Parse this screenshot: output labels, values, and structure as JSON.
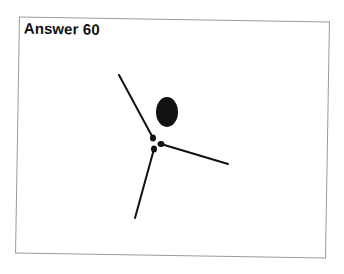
{
  "card": {
    "title": "Answer 60"
  },
  "figure": {
    "stroke_color": "#111111",
    "lines": [
      {
        "name": "upper-left-line",
        "x1": 119,
        "y1": 75,
        "x2": 153,
        "y2": 138
      },
      {
        "name": "right-line",
        "x1": 161,
        "y1": 144,
        "x2": 228,
        "y2": 164
      },
      {
        "name": "lower-line",
        "x1": 154,
        "y1": 149,
        "x2": 135,
        "y2": 218
      }
    ],
    "dots": [
      {
        "cx": 153,
        "cy": 138,
        "rx": 3,
        "ry": 3.5
      },
      {
        "cx": 161,
        "cy": 144,
        "rx": 3.5,
        "ry": 3
      },
      {
        "cx": 154,
        "cy": 149,
        "rx": 3,
        "ry": 3.5
      }
    ],
    "oval": {
      "cx": 167,
      "cy": 112,
      "rx": 11,
      "ry": 15
    }
  }
}
